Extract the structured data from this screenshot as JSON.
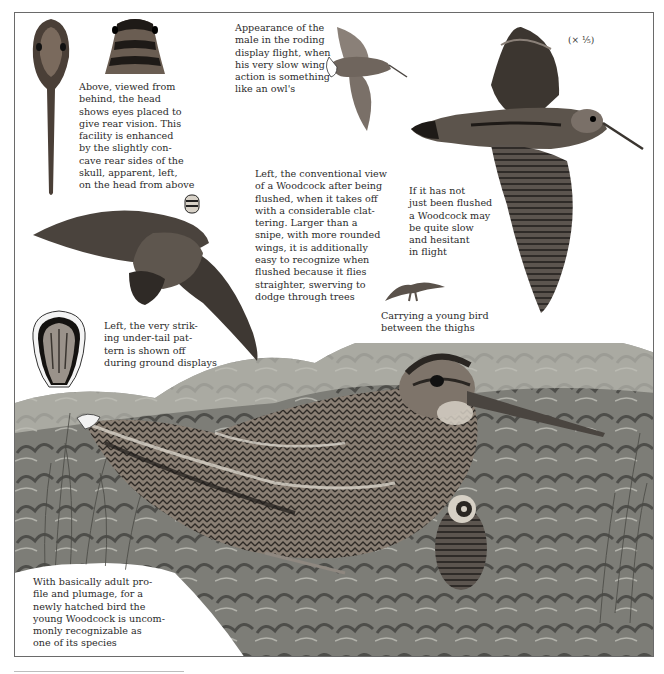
{
  "plate": {
    "subject": "Woodcock",
    "scale_note": "(× ⅕)",
    "captions": {
      "head_views": "Above, viewed from\nbehind, the head\nshows eyes placed to\ngive rear vision. This\nfacility is enhanced\nby the slightly con-\ncave rear sides of the\nskull, apparent, left,\non the head from above",
      "roding_flight": "Appearance of the\nmale in the roding\ndisplay flight, when\nhis very slow wing\naction is something\nlike an owl's",
      "flushed_view": "Left, the conventional view\nof a Woodcock after being\nflushed, when it takes off\nwith a considerable clat-\ntering. Larger than a\nsnipe, with more rounded\nwings, it is additionally\neasy to recognize when\nflushed because it flies\nstraighter, swerving to\ndodge through trees",
      "slow_flight": "If it has not\njust been flushed\na Woodcock may\nbe quite slow\nand hesitant\nin flight",
      "carrying_young": "Carrying a young bird\nbetween the thighs",
      "under_tail": "Left, the very strik-\ning under-tail pat-\ntern is shown off\nduring ground displays",
      "young_bird": "With basically adult pro-\nfile and plumage, for a\nnewly hatched bird the\nyoung Woodcock is uncom-\nmonly recognizable as\none of its species"
    }
  },
  "colors": {
    "border": "#6a6a6a",
    "text": "#2b2b2b",
    "plumage_dark": "#2e2a26",
    "plumage_mid": "#6b625a",
    "plumage_light": "#a9a096",
    "ground_dark": "#3b3b38",
    "ground_mid": "#7a7a74",
    "ground_light": "#b9b9b2"
  }
}
